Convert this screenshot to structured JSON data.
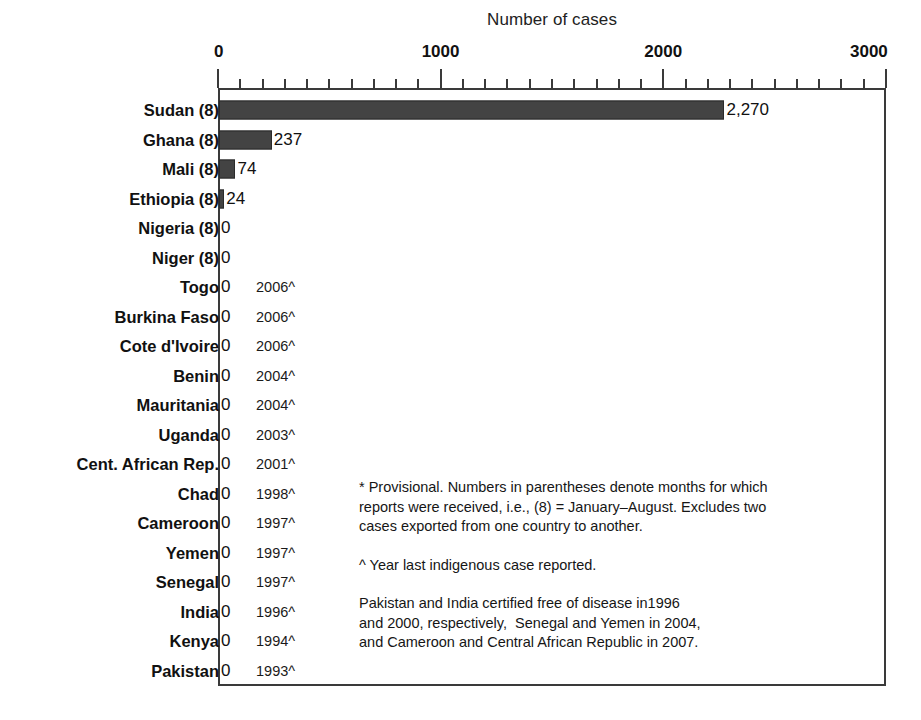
{
  "chart_data": {
    "type": "bar",
    "orientation": "horizontal",
    "title": "Number of cases",
    "xlabel": "Number of cases",
    "ylabel": "",
    "xlim": [
      0,
      3000
    ],
    "xticks": [
      0,
      1000,
      2000,
      3000
    ],
    "xtick_labels": [
      "0",
      "1000",
      "2000",
      "3000"
    ],
    "minor_tick_interval": 100,
    "grid": false,
    "legend": "none",
    "bar_color": "#434343",
    "categories": [
      "Sudan (8)",
      "Ghana (8)",
      "Mali (8)",
      "Ethiopia (8)",
      "Nigeria (8)",
      "Niger (8)",
      "Togo",
      "Burkina Faso",
      "Cote d'Ivoire",
      "Benin",
      "Mauritania",
      "Uganda",
      "Cent. African Rep.",
      "Chad",
      "Cameroon",
      "Yemen",
      "Senegal",
      "India",
      "Kenya",
      "Pakistan"
    ],
    "values": [
      2270,
      237,
      74,
      24,
      0,
      0,
      0,
      0,
      0,
      0,
      0,
      0,
      0,
      0,
      0,
      0,
      0,
      0,
      0,
      0
    ],
    "value_labels": [
      "2,270",
      "237",
      "74",
      "24",
      "0",
      "0",
      "0",
      "0",
      "0",
      "0",
      "0",
      "0",
      "0",
      "0",
      "0",
      "0",
      "0",
      "0",
      "0",
      "0"
    ],
    "annotations_year_last_case": [
      "",
      "",
      "",
      "",
      "",
      "",
      "2006^",
      "2006^",
      "2006^",
      "2004^",
      "2004^",
      "2003^",
      "2001^",
      "1998^",
      "1997^",
      "1997^",
      "1997^",
      "1996^",
      "1994^",
      "1993^"
    ]
  },
  "rows": [
    {
      "label": "Sudan (8)",
      "value": 2270,
      "value_label": "2,270",
      "year": ""
    },
    {
      "label": "Ghana (8)",
      "value": 237,
      "value_label": "237",
      "year": ""
    },
    {
      "label": "Mali (8)",
      "value": 74,
      "value_label": "74",
      "year": ""
    },
    {
      "label": "Ethiopia (8)",
      "value": 24,
      "value_label": "24",
      "year": ""
    },
    {
      "label": "Nigeria (8)",
      "value": 0,
      "value_label": "0",
      "year": ""
    },
    {
      "label": "Niger (8)",
      "value": 0,
      "value_label": "0",
      "year": ""
    },
    {
      "label": "Togo",
      "value": 0,
      "value_label": "0",
      "year": "2006^"
    },
    {
      "label": "Burkina Faso",
      "value": 0,
      "value_label": "0",
      "year": "2006^"
    },
    {
      "label": "Cote d'Ivoire",
      "value": 0,
      "value_label": "0",
      "year": "2006^"
    },
    {
      "label": "Benin",
      "value": 0,
      "value_label": "0",
      "year": "2004^"
    },
    {
      "label": "Mauritania",
      "value": 0,
      "value_label": "0",
      "year": "2004^"
    },
    {
      "label": "Uganda",
      "value": 0,
      "value_label": "0",
      "year": "2003^"
    },
    {
      "label": "Cent. African Rep.",
      "value": 0,
      "value_label": "0",
      "year": "2001^"
    },
    {
      "label": "Chad",
      "value": 0,
      "value_label": "0",
      "year": "1998^"
    },
    {
      "label": "Cameroon",
      "value": 0,
      "value_label": "0",
      "year": "1997^"
    },
    {
      "label": "Yemen",
      "value": 0,
      "value_label": "0",
      "year": "1997^"
    },
    {
      "label": "Senegal",
      "value": 0,
      "value_label": "0",
      "year": "1997^"
    },
    {
      "label": "India",
      "value": 0,
      "value_label": "0",
      "year": "1996^"
    },
    {
      "label": "Kenya",
      "value": 0,
      "value_label": "0",
      "year": "1994^"
    },
    {
      "label": "Pakistan",
      "value": 0,
      "value_label": "0",
      "year": "1993^"
    }
  ],
  "footnotes": [
    [
      "* Provisional. Numbers in parentheses denote months for which",
      "reports were received, i.e., (8) = January–August. Excludes two",
      "cases exported from one country to another."
    ],
    [
      "^ Year last indigenous case reported."
    ],
    [
      "Pakistan and India certified free of disease in1996",
      "and 2000, respectively,  Senegal and Yemen in 2004,",
      "and Cameroon and Central African Republic in 2007."
    ]
  ]
}
